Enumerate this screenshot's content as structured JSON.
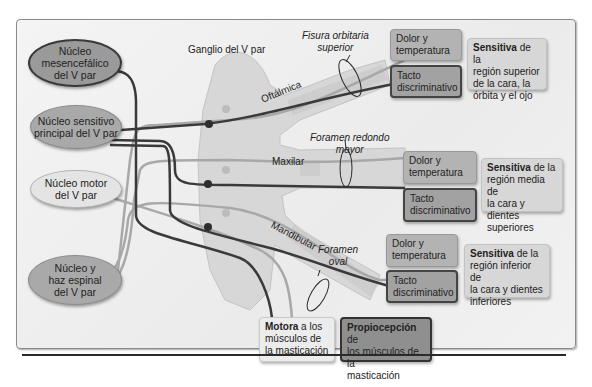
{
  "nuclei": {
    "mesencefalico": {
      "line1": "Núcleo",
      "line2": "mesencefálico",
      "line3": "del V par"
    },
    "sensitivo": {
      "line1": "Núcleo sensitivo",
      "line2": "principal del V par"
    },
    "motor": {
      "line1": "Núcleo motor",
      "line2": "del V par"
    },
    "espinal": {
      "line1": "Núcleo y",
      "line2": "haz espinal",
      "line3": "del V par"
    }
  },
  "ganglion": {
    "label": "Ganglio del V par"
  },
  "branches": {
    "oftalmica": {
      "label": "Oftálmica",
      "foramen_line1": "Fisura orbitaria",
      "foramen_line2": "superior"
    },
    "maxilar": {
      "label": "Maxilar",
      "foramen_line1": "Foramen redondo",
      "foramen_line2": "mayor"
    },
    "mandibular": {
      "label": "Mandibular",
      "foramen_line1": "Foramen",
      "foramen_line2": "oval"
    }
  },
  "outputs": {
    "oftalmica": {
      "pain": {
        "line1": "Dolor y",
        "line2": "temperatura"
      },
      "touch": {
        "line1": "Tacto",
        "line2": "discriminativo"
      },
      "sensitive": {
        "bold": "Sensitiva",
        "rest1": " de la",
        "line2": "región superior",
        "line3": "de la cara, la",
        "line4": "órbita y el ojo"
      }
    },
    "maxilar": {
      "pain": {
        "line1": "Dolor y",
        "line2": "temperatura"
      },
      "touch": {
        "line1": "Tacto",
        "line2": "discriminativo"
      },
      "sensitive": {
        "bold": "Sensitiva",
        "rest1": " de la",
        "line2": "región media de",
        "line3": "la cara y dientes",
        "line4": "superiores"
      }
    },
    "mandibular": {
      "pain": {
        "line1": "Dolor y",
        "line2": "temperatura"
      },
      "touch": {
        "line1": "Tacto",
        "line2": "discriminativo"
      },
      "sensitive": {
        "bold": "Sensitiva",
        "rest1": " de la",
        "line2": "región inferior de",
        "line3": "la cara y dientes",
        "line4": "inferiores"
      }
    },
    "motora": {
      "bold": "Motora",
      "rest1": " a los",
      "line2": "músculos de",
      "line3": "la masticación"
    },
    "propiocepcion": {
      "bold": "Propiocepción",
      "rest1": " de",
      "line2": "los músculos de la",
      "line3": "masticación"
    }
  },
  "colors": {
    "dark_fiber": "#3a3a3a",
    "light_fiber": "#a8a8a8",
    "ganglion_fill": "#d6d6d6",
    "panel_border": "#8a8a8a"
  }
}
